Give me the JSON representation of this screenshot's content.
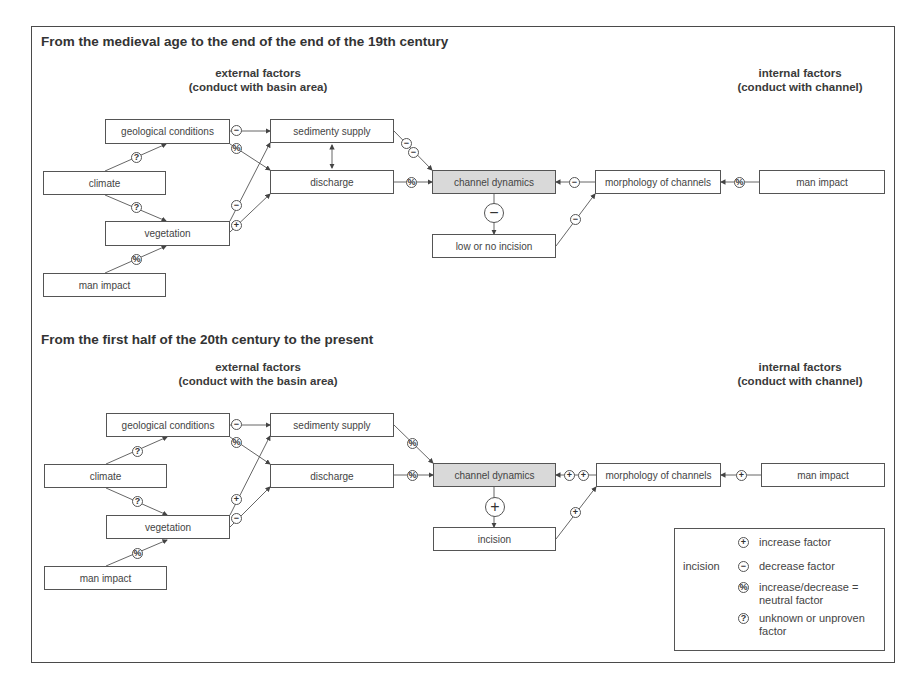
{
  "symbols": {
    "plus": "+",
    "minus": "−",
    "neutral": "%",
    "unknown": "?"
  },
  "colors": {
    "frame": "#4a4a4a",
    "box_border": "#555555",
    "core_fill": "#d9d9d9",
    "text": "#444444"
  },
  "top": {
    "title": "From the medieval age to the end of the end of the 19th century",
    "external_heading": "external factors",
    "external_sub": "(conduct with basin area)",
    "internal_heading": "internal factors",
    "internal_sub": "(conduct with channel)",
    "boxes": {
      "geological": "geological conditions",
      "climate": "climate",
      "vegetation": "vegetation",
      "man_impact_left": "man impact",
      "sediment": "sedimenty supply",
      "discharge": "discharge",
      "channel": "channel dynamics",
      "outcome": "low or no incision",
      "morphology": "morphology of channels",
      "man_impact_right": "man impact"
    }
  },
  "bottom": {
    "title": "From the first half of the 20th century to the present",
    "external_heading": "external factors",
    "external_sub": "(conduct with the basin area)",
    "internal_heading": "internal factors",
    "internal_sub": "(conduct with channel)",
    "boxes": {
      "geological": "geological conditions",
      "climate": "climate",
      "vegetation": "vegetation",
      "man_impact_left": "man impact",
      "sediment": "sedimenty supply",
      "discharge": "discharge",
      "channel": "channel dynamics",
      "outcome": "incision",
      "morphology": "morphology of channels",
      "man_impact_right": "man impact"
    }
  },
  "legend": {
    "label": "incision",
    "items": [
      {
        "symbol": "+",
        "text": "increase factor"
      },
      {
        "symbol": "−",
        "text": "decrease factor"
      },
      {
        "symbol": "%",
        "text": "increase/decrease = neutral factor"
      },
      {
        "symbol": "?",
        "text": "unknown or unproven factor"
      }
    ]
  }
}
